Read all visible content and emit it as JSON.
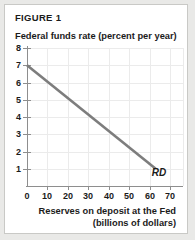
{
  "figure": {
    "label": "FIGURE 1",
    "curve_label": "RD"
  },
  "axis_titles": {
    "y": "Federal funds rate (percent per year)",
    "x_line1": "Reserves on deposit at the Fed",
    "x_line2": "(billions of dollars)"
  },
  "colors": {
    "card_background": "#ffffff",
    "page_background": "#e9e9e7",
    "card_border": "#c9c9c6",
    "axis": "#8e8e8e",
    "gridline": "#ebebeb",
    "curve": "#7d7d7d",
    "text": "#1b1b1b"
  },
  "chart_data": {
    "type": "line",
    "title": "FIGURE 1",
    "xlabel": "Reserves on deposit at the Fed (billions of dollars)",
    "ylabel": "Federal funds rate (percent per year)",
    "xlim": [
      0,
      76
    ],
    "ylim": [
      0,
      8
    ],
    "xticks": [
      0,
      10,
      20,
      30,
      40,
      50,
      60,
      70
    ],
    "xticklabels": [
      "0",
      "10",
      "20",
      "30",
      "40",
      "50",
      "60",
      "70"
    ],
    "yticks": [
      1,
      2,
      3,
      4,
      5,
      6,
      7,
      8
    ],
    "yticklabels": [
      "1",
      "2",
      "3",
      "4",
      "5",
      "6",
      "7",
      "8"
    ],
    "grid": true,
    "legend": "none",
    "series": [
      {
        "name": "RD",
        "annotation": "RD",
        "x": [
          0,
          63
        ],
        "y": [
          7,
          1
        ],
        "points": [
          {
            "x": 0,
            "y": 7
          },
          {
            "x": 10,
            "y": 6.05
          },
          {
            "x": 20,
            "y": 5.1
          },
          {
            "x": 30,
            "y": 4.14
          },
          {
            "x": 40,
            "y": 3.19
          },
          {
            "x": 50,
            "y": 2.24
          },
          {
            "x": 60,
            "y": 1.29
          },
          {
            "x": 63,
            "y": 1
          }
        ]
      }
    ]
  }
}
